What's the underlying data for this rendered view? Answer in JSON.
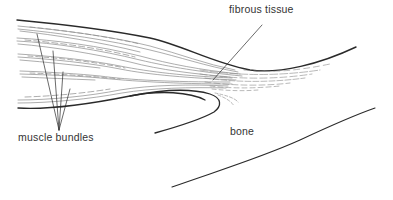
{
  "figure": {
    "labels": {
      "fibrous_tissue": "fibrous tissue",
      "muscle_bundles": "muscle bundles",
      "bone": "bone"
    },
    "colors": {
      "ink": "#2a2a2a",
      "fiber": "#8a8a8a",
      "text": "#333333",
      "background": "#ffffff"
    }
  }
}
